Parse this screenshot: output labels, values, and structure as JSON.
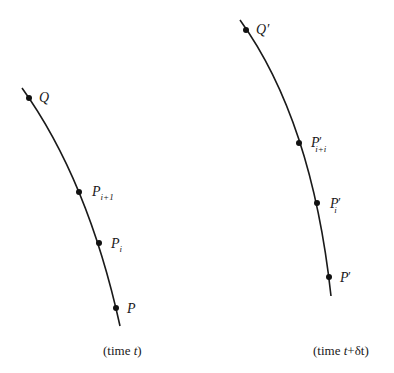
{
  "figure": {
    "left_panel": {
      "caption_prefix": "(time ",
      "caption_var": "t",
      "caption_suffix": ")",
      "points": [
        {
          "base": "Q",
          "prime": "",
          "sub": ""
        },
        {
          "base": "P",
          "prime": "",
          "sub": "i+1"
        },
        {
          "base": "P",
          "prime": "",
          "sub": "i"
        },
        {
          "base": "P",
          "prime": "",
          "sub": ""
        }
      ]
    },
    "right_panel": {
      "caption_prefix": "(time ",
      "caption_var": "t",
      "caption_plus": "+",
      "caption_delta": "δt",
      "caption_suffix": ")",
      "points": [
        {
          "base": "Q",
          "prime": "′",
          "sub": ""
        },
        {
          "base": "P",
          "prime": "′",
          "sub": "i+i"
        },
        {
          "base": "P",
          "prime": "′",
          "sub": "i"
        },
        {
          "base": "P",
          "prime": "′",
          "sub": ""
        }
      ]
    },
    "colors": {
      "ink": "#1a1a1a",
      "background": "#ffffff"
    }
  }
}
